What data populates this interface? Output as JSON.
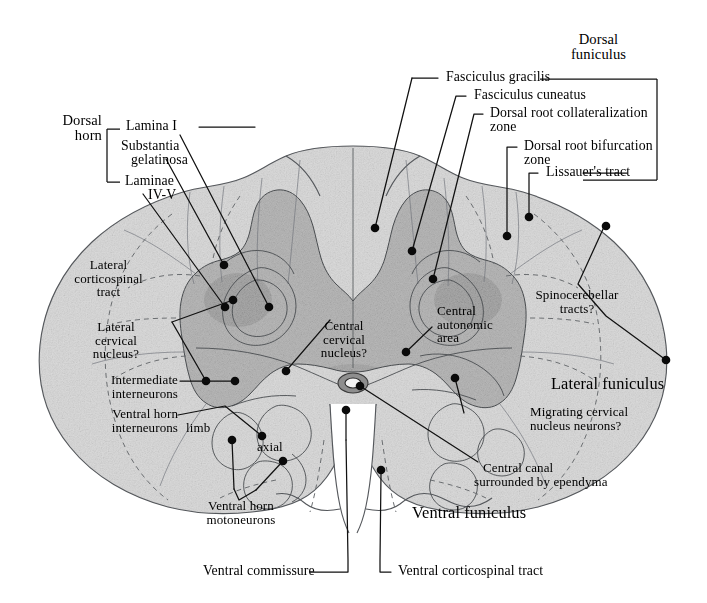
{
  "figure": {
    "background_color": "#ffffff",
    "ink_color": "#000000",
    "tissue_fill": "#dcdcdc",
    "gray_matter_fill": "#b9b9b9"
  },
  "group_labels": {
    "dorsal_horn": {
      "line1": "Dorsal",
      "line2": "horn"
    },
    "dorsal_funiculus": {
      "line1": "Dorsal",
      "line2": "funiculus"
    }
  },
  "labels": {
    "lamina_i": "Lamina I",
    "substantia_gelatinosa_l1": "Substantia",
    "substantia_gelatinosa_l2": "gelatinosa",
    "laminae_iv_v_l1": "Laminae",
    "laminae_iv_v_l2": "IV-V",
    "fasciculus_gracilis": "Fasciculus gracilis",
    "fasciculus_cuneatus": "Fasciculus cuneatus",
    "dorsal_root_collateralization_l1": "Dorsal root collateralization",
    "dorsal_root_collateralization_l2": "zone",
    "dorsal_root_bifurcation_l1": "Dorsal root bifurcation",
    "dorsal_root_bifurcation_l2": "zone",
    "lissauers_tract": "Lissauer's tract",
    "lateral_corticospinal_l1": "Lateral",
    "lateral_corticospinal_l2": "corticospinal",
    "lateral_corticospinal_l3": "tract",
    "lateral_cervical_nucleus_l1": "Lateral",
    "lateral_cervical_nucleus_l2": "cervical",
    "lateral_cervical_nucleus_l3": "nucleus?",
    "central_cervical_nucleus_l1": "Central",
    "central_cervical_nucleus_l2": "cervical",
    "central_cervical_nucleus_l3": "nucleus?",
    "central_autonomic_area_l1": "Central",
    "central_autonomic_area_l2": "autonomic",
    "central_autonomic_area_l3": "area",
    "spinocerebellar_tracts_l1": "Spinocerebellar",
    "spinocerebellar_tracts_l2": "tracts?",
    "lateral_funiculus": "Lateral funiculus",
    "intermediate_interneurons_l1": "Intermediate",
    "intermediate_interneurons_l2": "interneurons",
    "ventral_horn_interneurons_l1": "Ventral horn",
    "ventral_horn_interneurons_l2": "interneurons",
    "migrating_cervical_l1": "Migrating cervical",
    "migrating_cervical_l2": "nucleus neurons?",
    "limb": "limb",
    "axial": "axial",
    "central_canal_l1": "Central canal",
    "central_canal_l2": "surrounded by ependyma",
    "ventral_funiculus": "Ventral funiculus",
    "ventral_horn_motoneurons_l1": "Ventral horn",
    "ventral_horn_motoneurons_l2": "motoneurons",
    "ventral_commissure": "Ventral commissure",
    "ventral_corticospinal_tract": "Ventral corticospinal tract"
  }
}
